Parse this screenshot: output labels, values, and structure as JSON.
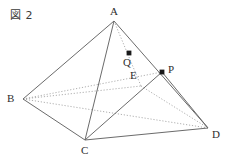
{
  "figure": {
    "caption": "図 2",
    "width": 234,
    "height": 160,
    "background_color": "#ffffff",
    "solid_line_color": "#6b6b6b",
    "dotted_line_color": "#9a9a9a",
    "point_marker_color": "#1a1a1a",
    "label_color": "#2e2e2e"
  },
  "vertices": {
    "A": {
      "label": "A",
      "x": 114,
      "y": 21,
      "label_x": 110,
      "label_y": 6
    },
    "B": {
      "label": "B",
      "x": 23,
      "y": 99,
      "label_x": 7,
      "label_y": 93
    },
    "C": {
      "label": "C",
      "x": 85,
      "y": 140,
      "label_x": 81,
      "label_y": 145
    },
    "D": {
      "label": "D",
      "x": 208,
      "y": 128,
      "label_x": 212,
      "label_y": 129
    },
    "E": {
      "label": "E",
      "x": 141,
      "y": 86,
      "label_x": 130,
      "label_y": 70
    },
    "P": {
      "label": "P",
      "x": 162,
      "y": 72,
      "label_x": 168,
      "label_y": 64
    },
    "Q": {
      "label": "Q",
      "x": 129,
      "y": 53,
      "label_x": 123,
      "label_y": 57
    }
  },
  "marked_points": [
    {
      "name": "Q",
      "x": 129,
      "y": 53
    },
    {
      "name": "P",
      "x": 162,
      "y": 72
    }
  ],
  "solid_edges": [
    {
      "name": "edge-A-B",
      "from": "A",
      "to": "B"
    },
    {
      "name": "edge-A-C",
      "from": "A",
      "to": "C"
    },
    {
      "name": "edge-A-D",
      "from": "A",
      "to": "D"
    },
    {
      "name": "edge-B-C",
      "from": "B",
      "to": "C"
    },
    {
      "name": "edge-C-D",
      "from": "C",
      "to": "D"
    },
    {
      "name": "edge-C-P",
      "from": "C",
      "to": "P"
    },
    {
      "name": "edge-P-D",
      "from": "P",
      "to": "D"
    }
  ],
  "dotted_edges": [
    {
      "name": "edge-B-E",
      "from": "B",
      "to": "E"
    },
    {
      "name": "edge-B-D",
      "from": "B",
      "to": "D"
    },
    {
      "name": "edge-B-P",
      "from": "B",
      "to": "P"
    },
    {
      "name": "edge-A-E",
      "from": "A",
      "to": "E"
    },
    {
      "name": "edge-E-D",
      "from": "E",
      "to": "D"
    }
  ]
}
